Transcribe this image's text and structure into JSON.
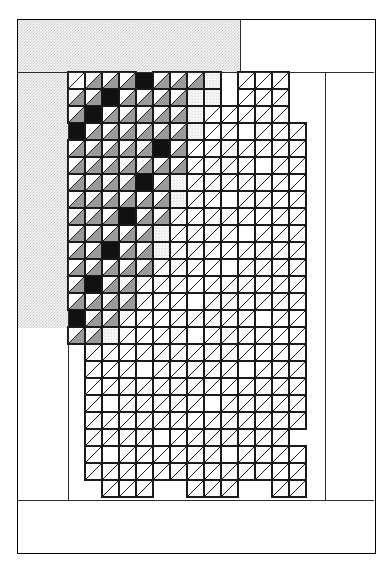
{
  "figure": {
    "caption": "FIG. 2",
    "type": "patent-drawing",
    "canvas": {
      "width": 392,
      "height": 568
    },
    "frame": {
      "name": "outer-border",
      "x": 17,
      "y": 19,
      "width": 358,
      "height": 534,
      "stroke": "#000000",
      "stroke_width": 1,
      "fill": "#ffffff"
    },
    "shaded_region": {
      "name": "background-fabric-panel",
      "label": "stippled background panel",
      "fill": "#ededed",
      "dot_color": "#bdbdbd",
      "rects": [
        {
          "x": 18,
          "y": 20,
          "width": 222,
          "height": 52
        },
        {
          "x": 18,
          "y": 72,
          "width": 50,
          "height": 256
        }
      ]
    },
    "grid": {
      "name": "triangle-unit-grid",
      "origin_x": 68,
      "origin_y": 72,
      "cell": 17,
      "cols": 15,
      "rows": 25,
      "diagonal": "bottom-left-to-top-right",
      "stroke": "#1a1a1a",
      "stroke_width": 1.1,
      "legend": [
        {
          "key": "W",
          "label": "white unit",
          "fill": "#ffffff"
        },
        {
          "key": "G",
          "label": "gray print unit",
          "fill": "#9a9a9a"
        },
        {
          "key": "K",
          "label": "dark solid unit",
          "fill": "#111111"
        },
        {
          "key": "D",
          "label": "dotted background unit",
          "fill": "#e8e8e8"
        },
        {
          "key": ".",
          "label": "empty / no unit",
          "fill": null
        }
      ],
      "rows_data": [
        "WGGGKGGGD.WWW..",
        "GGKGGGGDD.WWW..",
        "GKGGGGGDWWWWW..",
        "KGGGGGGDWW.WWW.",
        "GGGGGKGWWWWWWW.",
        "GGGGGGGWWWW.WW.",
        "GGGGKGDWWWWWWW.",
        "GGGGGGDWW.WWWW.",
        "GGGKGGWWWWWWWW.",
        "GGGGGDWWWW.WWW.",
        "GGKGGDWWWWWWWW.",
        "GGGGGWWWW.WWWW.",
        "GKGGWWWWWWWWWW.",
        "GGGGWWW.WWWWWW.",
        "KGGWWWWWWWW.WW.",
        "GGDWWWW.WWWWWW.",
        ".WWWWWWWWWWWWW.",
        ".WWW.WWWWW.WWW.",
        ".WWWWWWWWWWWWW.",
        ".W.WWWWW.WWWWW.",
        ".WWWWWWWWWWWWW.",
        ".WWWW.WWWWWWW..",
        ".W.WWWWWW.WWWW.",
        ".WWWWWWWWWWWWW.",
        "..WWW..WWW..WW."
      ]
    },
    "inner_lines": {
      "name": "panel-division-lines",
      "segments": [
        {
          "x1": 68,
          "y1": 72,
          "x2": 68,
          "y2": 500
        },
        {
          "x1": 325,
          "y1": 72,
          "x2": 325,
          "y2": 500
        },
        {
          "x1": 18,
          "y1": 500,
          "x2": 374,
          "y2": 500
        },
        {
          "x1": 18,
          "y1": 72,
          "x2": 374,
          "y2": 72
        },
        {
          "x1": 240,
          "y1": 20,
          "x2": 240,
          "y2": 72
        }
      ],
      "stroke": "#2b2b2b",
      "stroke_width": 1
    }
  }
}
